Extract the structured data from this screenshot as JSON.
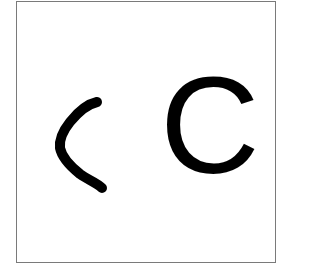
{
  "panel": {
    "handwritten_symbol": "<",
    "printed_letter": "C"
  },
  "colors": {
    "border": "#7a7a7a",
    "ink": "#000000",
    "background": "#ffffff"
  }
}
